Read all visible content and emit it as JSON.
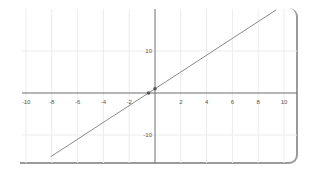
{
  "chart_data": {
    "type": "line",
    "title": "",
    "xlabel": "",
    "ylabel": "",
    "xlim": [
      -10.6,
      11
    ],
    "ylim": [
      -17,
      21
    ],
    "grid": true,
    "x_ticks": [
      -10,
      -8,
      -6,
      -4,
      -2,
      2,
      4,
      6,
      8,
      10
    ],
    "y_ticks": [
      10,
      -10
    ],
    "series": [
      {
        "name": "y = 2x + 1",
        "equation": "y = 2x + 1",
        "slope": 2,
        "intercept": 1,
        "x": [
          -8.1,
          9.4
        ],
        "y": [
          -15.2,
          19.8
        ]
      }
    ],
    "points": [
      {
        "x": -0.5,
        "y": 0,
        "label": "x-intercept"
      },
      {
        "x": 0,
        "y": 1,
        "label": "y-intercept"
      }
    ],
    "colors": {
      "line": "#8a8a8a",
      "axis": "#6e6e6e",
      "grid": "#ececec",
      "point": "#555555"
    }
  }
}
